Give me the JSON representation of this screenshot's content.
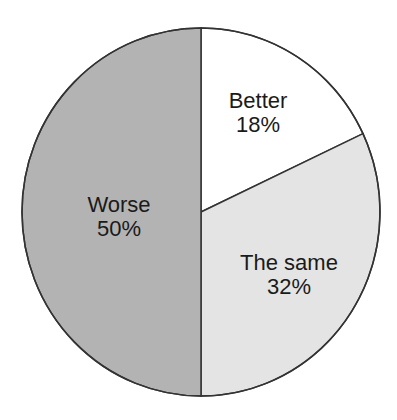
{
  "chart_data": {
    "type": "pie",
    "title": "",
    "categories": [
      "Better",
      "The same",
      "Worse"
    ],
    "values": [
      18,
      32,
      50
    ],
    "labels": [
      "Better 18%",
      "The same 32%",
      "Worse 50%"
    ],
    "start_angle": "12 o'clock, clockwise",
    "colors": [
      "#ffffff",
      "#e4e4e4",
      "#b3b3b3"
    ],
    "legend": "none (labels inside slices)"
  },
  "slices": [
    {
      "name": "Better",
      "pct": "18%",
      "color": "#ffffff"
    },
    {
      "name": "The same",
      "pct": "32%",
      "color": "#e4e4e4"
    },
    {
      "name": "Worse",
      "pct": "50%",
      "color": "#b3b3b3"
    }
  ]
}
